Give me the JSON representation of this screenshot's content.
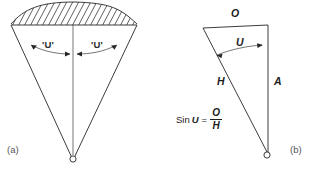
{
  "figure": {
    "background_color": "#ffffff",
    "ink_color": "#262626",
    "panels": [
      {
        "id": "a",
        "caption": "(a)",
        "description": "cone sector with hatched spherical cap, half-angles marked",
        "angle_label_left": "'U'",
        "angle_label_right": "'U'"
      },
      {
        "id": "b",
        "caption": "(b)",
        "description": "right triangle showing sine relation",
        "side_opposite_label": "O",
        "side_hypotenuse_label": "H",
        "side_adjacent_label": "A",
        "angle_label": "U",
        "formula": {
          "function": "Sin",
          "variable": "U",
          "equals": "=",
          "numerator": "O",
          "denominator": "H",
          "full_text": "Sin U = O / H"
        }
      }
    ]
  }
}
